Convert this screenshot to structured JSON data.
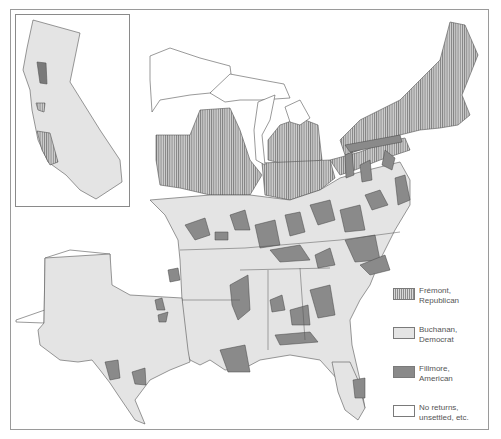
{
  "map": {
    "title": "Presidential election of 1856 by county",
    "inset": {
      "name": "California"
    },
    "colors": {
      "republican_fill": "#c8c8c8",
      "republican_hatch": "#7d7d7d",
      "democrat": "#e4e4e4",
      "american": "#8a8a8a",
      "no_returns": "#ffffff",
      "border": "#555555"
    }
  },
  "legend": {
    "items": [
      {
        "key": "republican",
        "line1": "Frémont,",
        "line2": "Republican"
      },
      {
        "key": "democrat",
        "line1": "Buchanan,",
        "line2": "Democrat"
      },
      {
        "key": "american",
        "line1": "Fillmore,",
        "line2": "American"
      },
      {
        "key": "none",
        "line1": "No returns,",
        "line2": "unsettled, etc."
      }
    ]
  }
}
